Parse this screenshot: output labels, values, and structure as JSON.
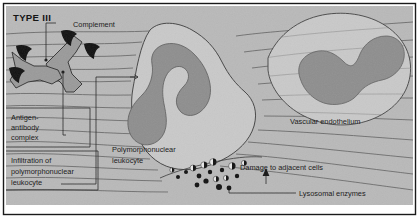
{
  "figure": {
    "type_label": "TYPE III",
    "title_semantic": "type-iii-hypersensitivity-immune-complex-reaction"
  },
  "labels": {
    "complement": "Complement",
    "antigen_antibody_complex": [
      "Antigen-",
      "antibody",
      "complex"
    ],
    "antigen_antibody_complex_full": "Antigen-antibody complex",
    "infiltration": [
      "Infiltration of",
      "polymorphonuclear",
      "leukocyte"
    ],
    "infiltration_full": "Infiltration of polymorphonuclear leukocyte",
    "polymorphonuclear_leukocyte": [
      "Polymorphonuclear",
      "leukocyte"
    ],
    "polymorphonuclear_leukocyte_full": "Polymorphonuclear leukocyte",
    "vascular_endothelium": "Vascular endothelium",
    "damage_to_adjacent_cells": "Damage to adjacent cells",
    "lysosomal_enzymes": "Lysosomal enzymes"
  },
  "colors": {
    "background": "#b9b9b9",
    "cell_body": "#c9c9c9",
    "nucleus": "#8e8e8e",
    "antibody_fill": "#9a9a9a",
    "complement_fill": "#141414",
    "granule_dark": "#101010",
    "granule_light": "#e8e8e8",
    "line": "#3a3a3a",
    "border": "#1a1a1a",
    "text": "#151515"
  },
  "elements": {
    "antibody_count": 2,
    "complement_marker_count": 4,
    "lysosomal_granule_count": 17,
    "cell_count": 2,
    "endothelium_fiber_lines": 17
  },
  "granules": [
    {
      "cx": 186,
      "cy": 172,
      "r": 2.0,
      "style": "dark"
    },
    {
      "cx": 193,
      "cy": 168,
      "r": 3.0,
      "style": "half"
    },
    {
      "cx": 199,
      "cy": 176,
      "r": 2.4,
      "style": "dark"
    },
    {
      "cx": 204,
      "cy": 165,
      "r": 3.2,
      "style": "half"
    },
    {
      "cx": 210,
      "cy": 172,
      "r": 2.2,
      "style": "dark"
    },
    {
      "cx": 213,
      "cy": 162,
      "r": 3.4,
      "style": "half"
    },
    {
      "cx": 206,
      "cy": 181,
      "r": 2.6,
      "style": "dark"
    },
    {
      "cx": 197,
      "cy": 185,
      "r": 2.4,
      "style": "dark"
    },
    {
      "cx": 216,
      "cy": 179,
      "r": 2.8,
      "style": "half"
    },
    {
      "cx": 222,
      "cy": 170,
      "r": 2.2,
      "style": "dark"
    },
    {
      "cx": 226,
      "cy": 178,
      "r": 2.6,
      "style": "half"
    },
    {
      "cx": 219,
      "cy": 187,
      "r": 3.0,
      "style": "dark"
    },
    {
      "cx": 232,
      "cy": 166,
      "r": 3.4,
      "style": "half"
    },
    {
      "cx": 237,
      "cy": 176,
      "r": 2.2,
      "style": "dark"
    },
    {
      "cx": 178,
      "cy": 177,
      "r": 2.0,
      "style": "dark"
    },
    {
      "cx": 172,
      "cy": 170,
      "r": 2.2,
      "style": "half"
    },
    {
      "cx": 244,
      "cy": 163,
      "r": 2.6,
      "style": "half"
    }
  ]
}
